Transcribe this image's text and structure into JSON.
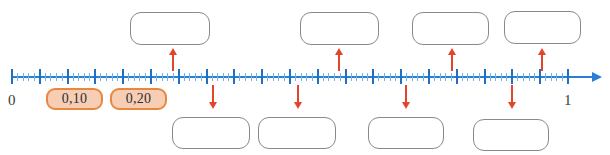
{
  "exercise": {
    "type": "number-line-decimal-placement",
    "line": {
      "start_label": "0",
      "end_label": "1",
      "start_value": 0,
      "end_value": 1,
      "major_step": 0.05,
      "minor_step": 0.01,
      "axis_color": "#2a7fd4",
      "arrow_direction": "right"
    },
    "given_values": [
      {
        "label": "0,10",
        "value": 0.1,
        "fill": "#f7cdb4",
        "border": "#e8873f"
      },
      {
        "label": "0,20",
        "value": 0.2,
        "fill": "#f7cdb4",
        "border": "#e8873f"
      }
    ],
    "answer_boxes_top": [
      {
        "label": "",
        "placeholder": ""
      },
      {
        "label": "",
        "placeholder": ""
      },
      {
        "label": "",
        "placeholder": ""
      },
      {
        "label": "",
        "placeholder": ""
      }
    ],
    "answer_boxes_bottom": [
      {
        "label": "",
        "placeholder": ""
      },
      {
        "label": "",
        "placeholder": ""
      },
      {
        "label": "",
        "placeholder": ""
      },
      {
        "label": "",
        "placeholder": ""
      }
    ],
    "pointer_color": "#e2452c",
    "pointers_up": [
      {
        "direction": "up"
      },
      {
        "direction": "up"
      },
      {
        "direction": "up"
      },
      {
        "direction": "up"
      }
    ],
    "pointers_down": [
      {
        "direction": "down"
      },
      {
        "direction": "down"
      },
      {
        "direction": "down"
      },
      {
        "direction": "down"
      }
    ]
  },
  "chart_data": {
    "type": "line",
    "title": "",
    "xlabel": "",
    "ylabel": "",
    "xlim": [
      0,
      1
    ],
    "grid": false,
    "legend": "none",
    "tick_labels": [
      "0",
      "1"
    ],
    "major_ticks": [
      0,
      0.05,
      0.1,
      0.15,
      0.2,
      0.25,
      0.3,
      0.35,
      0.4,
      0.45,
      0.5,
      0.55,
      0.6,
      0.65,
      0.7,
      0.75,
      0.8,
      0.85,
      0.9,
      0.95,
      1.0
    ],
    "minor_tick_step": 0.01,
    "annotations": [
      {
        "text": "0,10",
        "value": 0.1,
        "side": "below"
      },
      {
        "text": "0,20",
        "value": 0.2,
        "side": "below"
      }
    ],
    "markers_up": [
      0.275,
      0.565,
      0.76,
      0.915
    ],
    "markers_down": [
      0.345,
      0.49,
      0.675,
      0.86
    ]
  }
}
